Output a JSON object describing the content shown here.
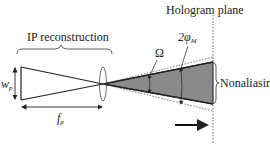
{
  "diagram": {
    "labels": {
      "ip_reconstruction": "IP reconstruction",
      "hologram_plane": "Hologram plane",
      "omega": "Ω",
      "two_phi": "2φ",
      "phi_sub": "M",
      "nonaliasing": "Nonaliasing",
      "wp_main": "w",
      "wp_sub": "p",
      "fp_main": "f",
      "fp_sub": "p"
    },
    "colors": {
      "line": "#222222",
      "shade": "#8a8a8a",
      "dotted": "#666666"
    }
  }
}
